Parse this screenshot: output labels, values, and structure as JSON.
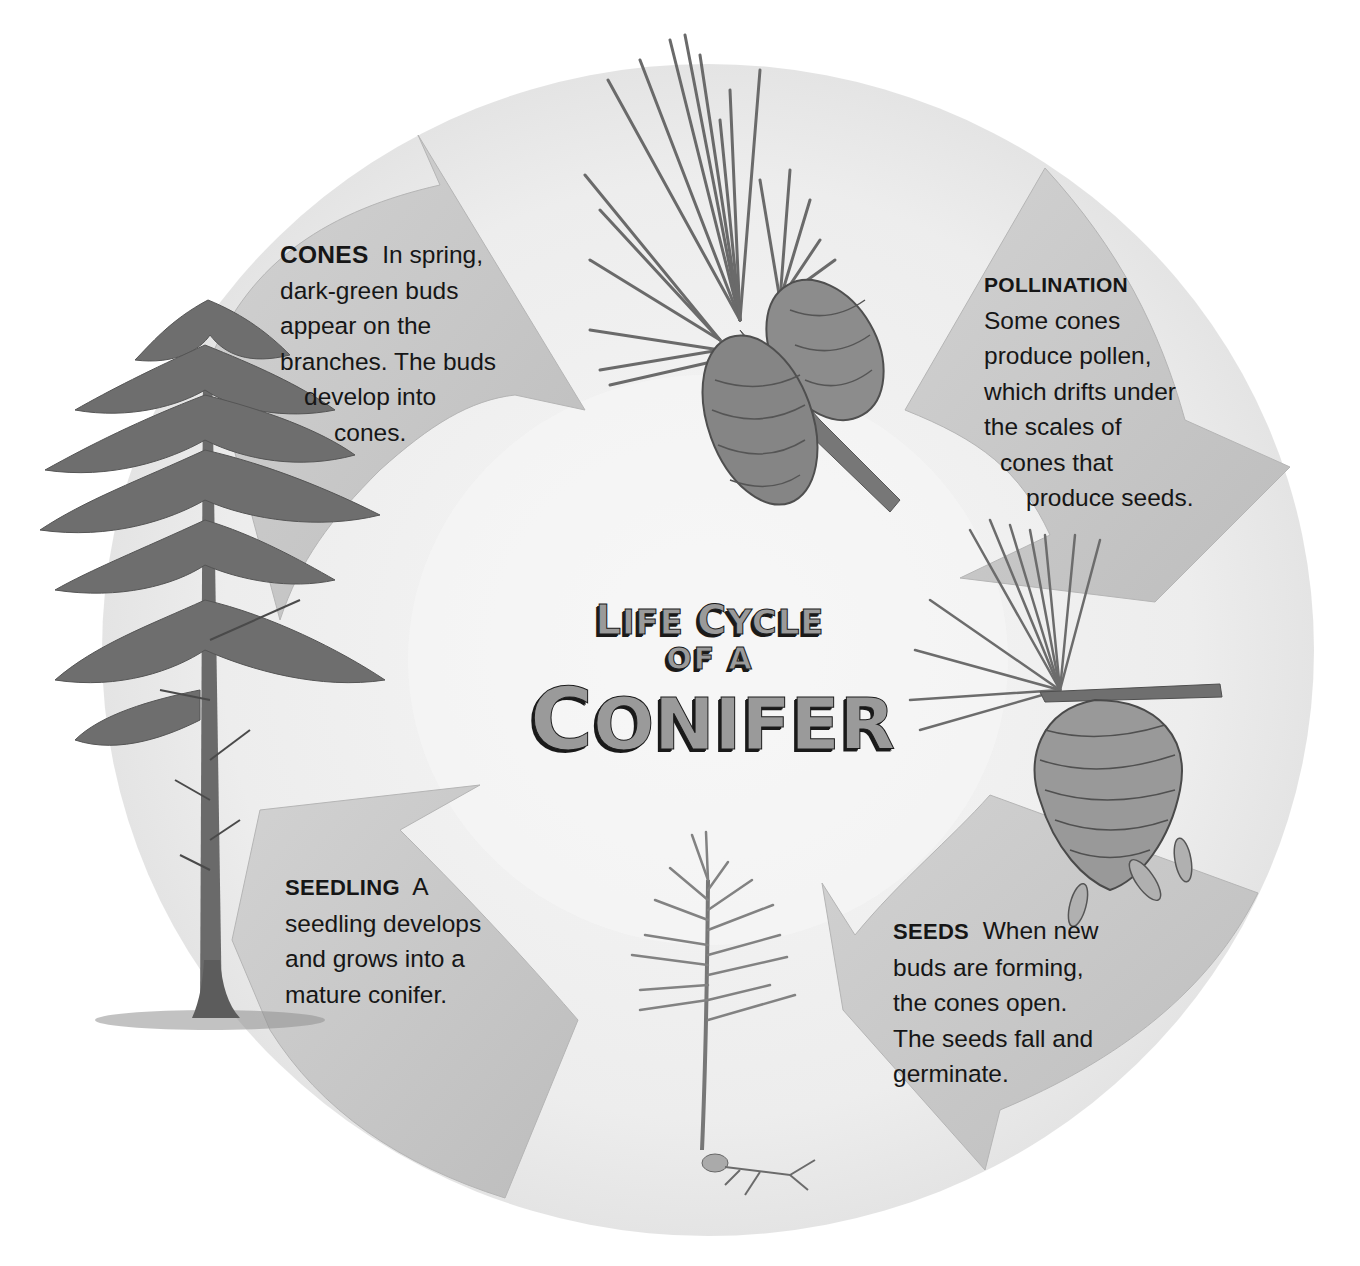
{
  "title": {
    "line1": [
      {
        "cap": "L",
        "rest": "IFE"
      },
      {
        "cap": "C",
        "rest": "YCLE"
      }
    ],
    "line2": "OF A",
    "line3": {
      "cap": "C",
      "rest": "ONIFER"
    },
    "full": "Life Cycle of a Conifer"
  },
  "stages": [
    {
      "id": "cones",
      "heading": "CONES",
      "lines": [
        "In spring,",
        "dark-green buds",
        "appear on the",
        "branches. The buds",
        "develop into",
        "cones."
      ],
      "illustration": "pine-branch-with-cones"
    },
    {
      "id": "pollination",
      "heading": "POLLINATION",
      "lines": [
        "Some cones",
        "produce pollen,",
        "which drifts under",
        "the scales of",
        "cones that",
        "produce seeds."
      ],
      "illustration": "open-cone-releasing-seeds"
    },
    {
      "id": "seeds",
      "heading": "SEEDS",
      "lines": [
        "When new",
        "buds are forming,",
        "the cones open.",
        "The seeds fall and",
        "germinate."
      ],
      "illustration": "seedling"
    },
    {
      "id": "seedling",
      "heading": "SEEDLING",
      "lines": [
        "A",
        "seedling develops",
        "and grows into a",
        "mature conifer."
      ],
      "illustration": "mature-conifer-tree"
    }
  ],
  "colors": {
    "circle": "#ececec",
    "arrow": "#c9c9c9",
    "arrow_edge": "#b0b0b0",
    "text": "#161616",
    "title_fill": "#9a9a9a",
    "title_shadow": "#1a1a1a"
  }
}
